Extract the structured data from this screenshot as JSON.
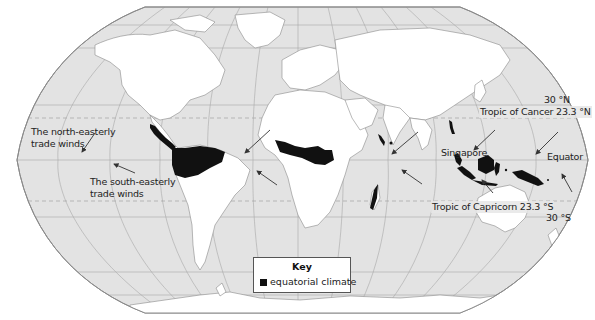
{
  "map": {
    "title": "World map of equatorial climate regions and trade winds",
    "colors": {
      "ocean": "#e3e3e3",
      "land": "#ffffff",
      "equatorial_climate": "#111111",
      "grid": "#9a9a9a",
      "border": "#8a8a8a"
    },
    "latitude_labels": {
      "n30": "30 °N",
      "tropic_cancer": "Tropic of Cancer 23.3 °N",
      "equator": "Equator",
      "tropic_capricorn": "Tropic of Capricorn 23.3 °S",
      "s30": "30 °S"
    },
    "place_labels": {
      "singapore": "Singapore"
    },
    "wind_labels": {
      "ne_trade": [
        "The north-easterly",
        "trade winds"
      ],
      "se_trade": [
        "The south-easterly",
        "trade winds"
      ]
    },
    "key": {
      "title": "Key",
      "items": [
        {
          "label": "equatorial climate",
          "color": "#111111"
        }
      ]
    }
  }
}
